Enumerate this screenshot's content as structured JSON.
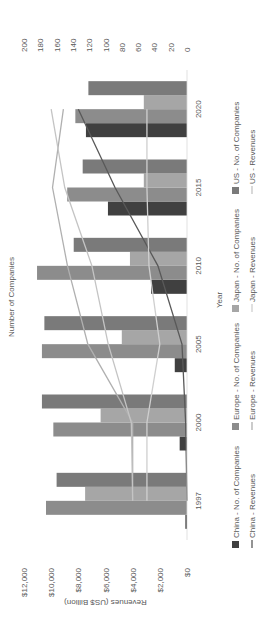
{
  "chart_data": {
    "type": "bar",
    "orientation_note": "rendered rotated 90deg counter-clockwise",
    "title": "",
    "xlabel": "Year",
    "ylabel": "Revenues (US$ Billion)",
    "y2label": "Number of Companies",
    "categories": [
      "1997",
      "2000",
      "2005",
      "2010",
      "2015",
      "2020"
    ],
    "ylim": [
      0,
      12000
    ],
    "y_ticks": [
      "$0",
      "$2,000",
      "$4,000",
      "$6,000",
      "$8,000",
      "$10,000",
      "$12,000"
    ],
    "y2lim": [
      0,
      200
    ],
    "y2_ticks": [
      "0",
      "20",
      "40",
      "60",
      "80",
      "100",
      "120",
      "140",
      "160",
      "180",
      "200"
    ],
    "grid": false,
    "legend_position": "bottom",
    "bar_series": [
      {
        "name": "China - No. of Companies",
        "color": "#404040",
        "values": [
          2,
          9,
          15,
          44,
          97,
          124
        ]
      },
      {
        "name": "Europe - No. of Companies",
        "color": "#8c8c8c",
        "values": [
          173,
          164,
          178,
          184,
          147,
          137
        ]
      },
      {
        "name": "Japan - No. of Companies",
        "color": "#a6a6a6",
        "values": [
          125,
          106,
          80,
          70,
          53,
          53
        ]
      },
      {
        "name": "US - No. of Companies",
        "color": "#7a7a7a",
        "values": [
          160,
          178,
          175,
          139,
          128,
          121
        ]
      }
    ],
    "line_series": [
      {
        "name": "China - Revenues",
        "color": "#595959",
        "values": [
          0,
          100,
          370,
          2140,
          5300,
          8000
        ]
      },
      {
        "name": "Europe - Revenues",
        "color": "#b0b0b0",
        "values": [
          4000,
          4000,
          7300,
          8800,
          9900,
          9100
        ]
      },
      {
        "name": "Japan - Revenues",
        "color": "#cfcfcf",
        "values": [
          2950,
          2950,
          2000,
          2800,
          2950,
          2950
        ]
      },
      {
        "name": "US - Revenues",
        "color": "#c4c4c4",
        "values": [
          4000,
          4100,
          5800,
          7000,
          9000,
          10000
        ]
      }
    ]
  }
}
